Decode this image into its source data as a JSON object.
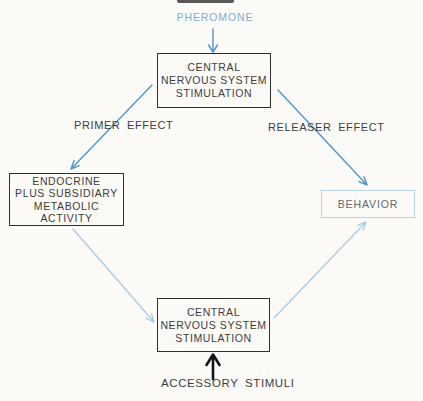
{
  "labels": {
    "pheromone": "PHEROMONE",
    "primer_effect": "PRIMER EFFECT",
    "releaser_effect": "RELEASER EFFECT",
    "accessory_stimuli": "ACCESSORY STIMULI"
  },
  "boxes": {
    "cns_top": {
      "lines": [
        "CENTRAL",
        "NERVOUS SYSTEM",
        "STIMULATION"
      ]
    },
    "endocrine": {
      "lines": [
        "ENDOCRINE",
        "PLUS SUBSIDIARY",
        "METABOLIC",
        "ACTIVITY"
      ]
    },
    "behavior": {
      "label": "BEHAVIOR"
    },
    "cns_bottom": {
      "lines": [
        "CENTRAL",
        "NERVOUS SYSTEM",
        "STIMULATION"
      ]
    }
  },
  "arrows": [
    {
      "name": "pheromone-to-cns-top",
      "color_role": "blue"
    },
    {
      "name": "cns-top-to-endocrine-primer",
      "color_role": "blue"
    },
    {
      "name": "cns-top-to-behavior-releaser",
      "color_role": "blue"
    },
    {
      "name": "endocrine-to-cns-bottom",
      "color_role": "light-blue"
    },
    {
      "name": "cns-bottom-to-behavior",
      "color_role": "light-blue"
    },
    {
      "name": "accessory-stimuli-to-cns-bottom",
      "color_role": "black"
    }
  ],
  "colors": {
    "background": "#fbfaf7",
    "arrow_blue": "#4e97cd",
    "arrow_light_blue": "#a9cbe3",
    "arrow_black": "#141414",
    "box_border": "#2f2f2f",
    "box_text": "#3d3d3d",
    "behavior_border": "#b7d3e8",
    "behavior_text": "#62686d",
    "pheromone_text": "#79aed8"
  }
}
